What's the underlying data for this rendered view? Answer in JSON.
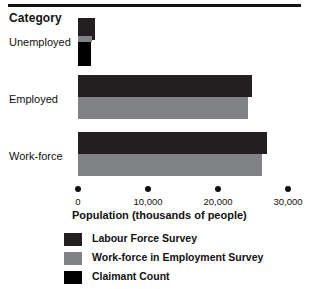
{
  "heading": "Category",
  "axis_title": "Population (thousands of people)",
  "categories": [
    {
      "label": "Unemployed"
    },
    {
      "label": "Employed"
    },
    {
      "label": "Work-force"
    }
  ],
  "ticks": [
    {
      "value": 0,
      "label": "0"
    },
    {
      "value": 10000,
      "label": "10,000"
    },
    {
      "value": 20000,
      "label": "20,000"
    },
    {
      "value": 30000,
      "label": "30,000"
    }
  ],
  "legend": [
    {
      "label": "Labour Force Survey",
      "color": "#231f20",
      "swatch": "sw-lfs"
    },
    {
      "label": "Work-force in Employment Survey",
      "color": "#808285",
      "swatch": "sw-wfe"
    },
    {
      "label": "Claimant Count",
      "color": "#000000",
      "swatch": "sw-claim"
    }
  ],
  "chart_data": {
    "type": "bar",
    "orientation": "horizontal",
    "title": "Category",
    "xlabel": "Population (thousands of people)",
    "ylabel": "Category",
    "xlim": [
      0,
      30000
    ],
    "grid": false,
    "legend_position": "bottom",
    "categories": [
      "Unemployed",
      "Employed",
      "Work-force"
    ],
    "series": [
      {
        "name": "Labour Force Survey",
        "color": "#231f20",
        "values": [
          2400,
          24800,
          27000
        ]
      },
      {
        "name": "Work-force in Employment Survey",
        "color": "#808285",
        "values": [
          2000,
          24300,
          26300
        ]
      },
      {
        "name": "Claimant Count",
        "color": "#000000",
        "values": [
          1850,
          null,
          null
        ]
      }
    ],
    "xticks": [
      0,
      10000,
      20000,
      30000
    ],
    "xticklabels": [
      "0",
      "10,000",
      "20,000",
      "30,000"
    ]
  }
}
